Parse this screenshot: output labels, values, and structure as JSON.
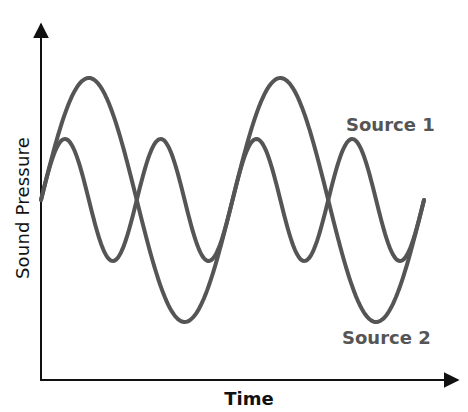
{
  "chart_data": {
    "type": "line",
    "title": "",
    "xlabel": "Time",
    "ylabel": "Sound Pressure",
    "grid": false,
    "legend": "inline labels",
    "series": [
      {
        "name": "Source 1",
        "description": "higher-frequency, smaller-amplitude sine wave",
        "relative_amplitude": 0.5,
        "relative_frequency": 2,
        "cycles_shown": 4,
        "color": "#555555"
      },
      {
        "name": "Source 2",
        "description": "lower-frequency, larger-amplitude sine wave",
        "relative_amplitude": 1.0,
        "relative_frequency": 1,
        "cycles_shown": 2,
        "color": "#555555"
      }
    ]
  },
  "labels": {
    "xlabel": "Time",
    "ylabel": "Sound Pressure",
    "source1": "Source 1",
    "source2": "Source 2"
  },
  "colors": {
    "curve": "#555555",
    "axis": "#111111",
    "background": "#ffffff"
  }
}
